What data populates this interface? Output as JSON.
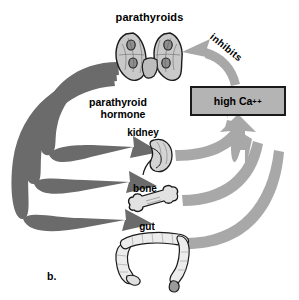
{
  "figure": {
    "letter": "b.",
    "caption_letter_name": "panel-b",
    "background_color": "#ffffff"
  },
  "colors": {
    "hormone_arrow": "#6b6b6b",
    "calcium_arrow": "#a8a8a8",
    "calcium_box_fill": "#b4b4b4",
    "calcium_box_border": "#1a1a1a",
    "organ_outline": "#1a1a1a",
    "organ_fill": "#cfcfcf",
    "text": "#000000"
  },
  "labels": {
    "parathyroids": "parathyroids",
    "parathyroid_hormone_line1": "parathyroid",
    "parathyroid_hormone_line2": "hormone",
    "kidney": "kidney",
    "bone": "bone",
    "gut": "gut",
    "inhibits": "inhibits"
  },
  "calcium_box": {
    "text": "high Ca",
    "superscript": "++"
  },
  "organs": [
    {
      "name": "parathyroids",
      "label": "parathyroids"
    },
    {
      "name": "kidney",
      "label": "kidney"
    },
    {
      "name": "bone",
      "label": "bone"
    },
    {
      "name": "gut",
      "label": "gut"
    }
  ],
  "flows": [
    {
      "from": "parathyroids",
      "to": "kidney",
      "via": "parathyroid hormone",
      "style": "dark"
    },
    {
      "from": "parathyroids",
      "to": "bone",
      "via": "parathyroid hormone",
      "style": "dark"
    },
    {
      "from": "parathyroids",
      "to": "gut",
      "via": "parathyroid hormone",
      "style": "dark"
    },
    {
      "from": "kidney",
      "to": "high Ca++",
      "style": "light"
    },
    {
      "from": "bone",
      "to": "high Ca++",
      "style": "light"
    },
    {
      "from": "gut",
      "to": "high Ca++",
      "style": "light"
    },
    {
      "from": "high Ca++",
      "to": "parathyroids",
      "label": "inhibits",
      "style": "light"
    }
  ]
}
